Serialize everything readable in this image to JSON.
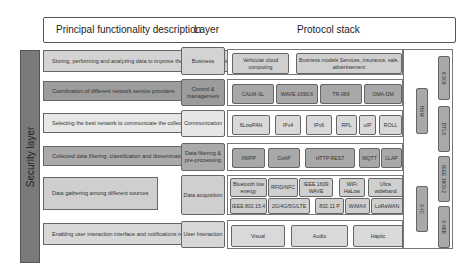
{
  "header": {
    "col1": "Principal functionality description",
    "col2": "Layer",
    "col3": "Protocol stack"
  },
  "security_layer": "Security layer",
  "rows": [
    {
      "description": "Storing, performing and analyzing data to improve the transportation system",
      "layer": "Business",
      "protocols": [
        "Vehicular cloud computing",
        "Business models Services, insurance, sale, advertisement"
      ]
    },
    {
      "description": "Coordination of different network service providers",
      "layer": "Control & management",
      "protocols": [
        "CALM-SL",
        "WAVE-1690.6",
        "TR-069",
        "OMA-DM"
      ]
    },
    {
      "description": "Selecting the best network to communicate the collected data",
      "layer": "Communication",
      "protocols": [
        "6LowPAN",
        "IPv4",
        "IPv6",
        "RPL",
        "uIP",
        "ROLL"
      ]
    },
    {
      "description": "Collected data filtering, classification and dissemination",
      "layer": "Data filtering & pre-processing",
      "protocols": [
        "XMPP",
        "CoAP",
        "HTTP REST",
        "MQTT",
        "LLAP"
      ]
    },
    {
      "description": "Data gathering among different sources",
      "layer": "Data acquisition",
      "protocols_row1": [
        "Bluetooth low energy",
        "RFID/NFC",
        "IEEE 1609 WAVE",
        "WiFi HaLow",
        "Ultra wideband"
      ],
      "protocols_row2": [
        "IEEE 802.15.4",
        "2G/4G/5G/LTE",
        "802.11 P",
        "WiMAX",
        "LoRaWAN"
      ]
    },
    {
      "description": "Enabling user interaction interface and notifications management",
      "layer": "User Interaction",
      "protocols": [
        "Visual",
        "Audio",
        "Haptic"
      ]
    }
  ],
  "side_bars": {
    "inner": [
      "HSM",
      "S-IC"
    ],
    "outer": [
      "X.509",
      "DTLS",
      "IEEE 1609.2",
      "S-MIB"
    ]
  }
}
